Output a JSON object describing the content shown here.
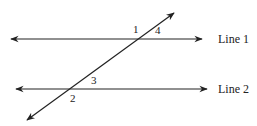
{
  "diagram": {
    "type": "parallel-lines-transversal",
    "lines": [
      {
        "id": "line1",
        "label": "Line 1",
        "y": 39,
        "x1": 11,
        "x2": 202
      },
      {
        "id": "line2",
        "label": "Line 2",
        "y": 89,
        "x1": 16,
        "x2": 207
      }
    ],
    "transversal": {
      "x1": 27,
      "y1": 120,
      "x2": 174,
      "y2": 13
    },
    "angles": [
      {
        "id": "angle-1",
        "label": "1",
        "x": 133,
        "y": 33
      },
      {
        "id": "angle-4",
        "label": "4",
        "x": 155,
        "y": 34
      },
      {
        "id": "angle-3",
        "label": "3",
        "x": 91,
        "y": 84
      },
      {
        "id": "angle-2",
        "label": "2",
        "x": 70,
        "y": 102
      }
    ],
    "colors": {
      "stroke": "#222222",
      "background": "#ffffff"
    }
  }
}
